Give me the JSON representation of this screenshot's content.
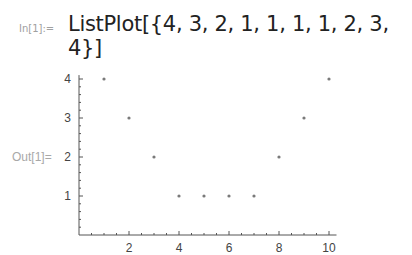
{
  "cell": {
    "in_label": "In[1]:=",
    "input_code": "ListPlot[{4, 3, 2, 1, 1, 1, 1, 2, 3, 4}]",
    "out_label": "Out[1]="
  },
  "chart_data": {
    "type": "scatter",
    "title": "",
    "xlabel": "",
    "ylabel": "",
    "x": [
      1,
      2,
      3,
      4,
      5,
      6,
      7,
      8,
      9,
      10
    ],
    "values": [
      4,
      3,
      2,
      1,
      1,
      1,
      1,
      2,
      3,
      4
    ],
    "x_ticks": [
      "2",
      "4",
      "6",
      "8",
      "10"
    ],
    "y_ticks": [
      "1",
      "2",
      "3",
      "4"
    ],
    "xlim": [
      0,
      10.3
    ],
    "ylim": [
      0,
      4.1
    ],
    "grid": false,
    "legend": null,
    "point_color": "#7a7a7a"
  }
}
